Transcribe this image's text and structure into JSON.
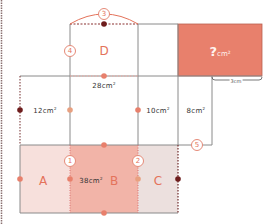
{
  "diagram": {
    "unknown_box": {
      "label_q": "?",
      "label_unit": "cm²",
      "color": "#e8806c"
    },
    "width_label": "3cm",
    "regions": {
      "A": {
        "label": "A",
        "color": "#f7e0dc"
      },
      "B": {
        "label": "B",
        "area": "38cm",
        "color": "#f2b4a8"
      },
      "C": {
        "label": "C",
        "color": "#ece0de"
      },
      "D": {
        "label": "D"
      }
    },
    "areas": {
      "left": "12cm",
      "middle": "28cm",
      "right_mid": "10cm",
      "right": "8cm"
    },
    "sup": "2",
    "markers": [
      "1",
      "2",
      "3",
      "4",
      "5"
    ],
    "colors": {
      "line": "#8a8a8a",
      "accent": "#e4735b",
      "dark_dot": "#6e1d1d",
      "light_dot": "#e8806c"
    }
  }
}
